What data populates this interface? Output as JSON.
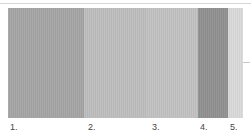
{
  "swatches": [
    {
      "label": "1.",
      "color": "#a4a4a4",
      "width": 78
    },
    {
      "label": "2.",
      "color": "#bdbdbd",
      "width": 64
    },
    {
      "label": "3.",
      "color": "#c1c1c1",
      "width": 53
    },
    {
      "label": "4.",
      "color": "#909090",
      "width": 31
    },
    {
      "label": "5.",
      "color": "#d9d9d9",
      "width": 15
    }
  ],
  "label_positions": [
    10,
    88,
    152,
    200,
    230
  ]
}
